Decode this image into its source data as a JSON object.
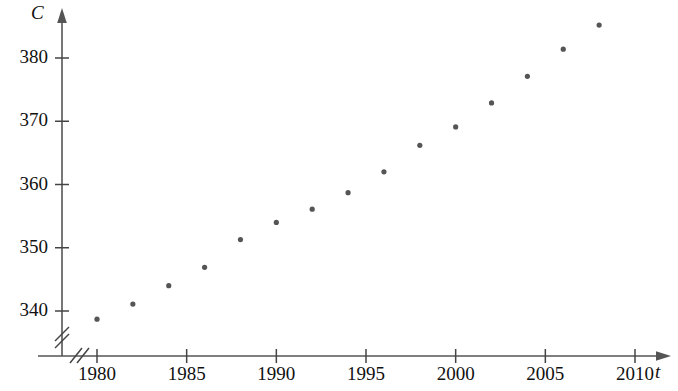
{
  "chart_data": {
    "type": "scatter",
    "title": "",
    "subtitle": "",
    "xlabel": "t",
    "ylabel": "C",
    "xlim": [
      1978,
      2011
    ],
    "ylim": [
      336,
      388
    ],
    "grid": false,
    "legend": "none",
    "axis_break_x": true,
    "axis_break_y": true,
    "point_color": "#555555",
    "axis_color": "#555555",
    "x_ticks": [
      1980,
      1985,
      1990,
      1995,
      2000,
      2005,
      2010
    ],
    "x_tick_labels": [
      "1980",
      "1985",
      "1990",
      "1995",
      "2000",
      "2005",
      "2010"
    ],
    "y_ticks": [
      340,
      350,
      360,
      370,
      380
    ],
    "y_tick_labels": [
      "340",
      "350",
      "360",
      "370",
      "380"
    ],
    "x": [
      1980,
      1982,
      1984,
      1986,
      1988,
      1990,
      1992,
      1994,
      1996,
      1998,
      2000,
      2002,
      2004,
      2006,
      2008
    ],
    "values": [
      338.7,
      341.1,
      344.0,
      346.9,
      351.3,
      354.0,
      356.1,
      358.7,
      362.0,
      366.2,
      369.1,
      372.9,
      377.1,
      381.4,
      385.2
    ],
    "points": [
      {
        "x": 1980,
        "y": 338.7
      },
      {
        "x": 1982,
        "y": 341.1
      },
      {
        "x": 1984,
        "y": 344.0
      },
      {
        "x": 1986,
        "y": 346.9
      },
      {
        "x": 1988,
        "y": 351.3
      },
      {
        "x": 1990,
        "y": 354.0
      },
      {
        "x": 1992,
        "y": 356.1
      },
      {
        "x": 1994,
        "y": 358.7
      },
      {
        "x": 1996,
        "y": 362.0
      },
      {
        "x": 1998,
        "y": 366.2
      },
      {
        "x": 2000,
        "y": 369.1
      },
      {
        "x": 2002,
        "y": 372.9
      },
      {
        "x": 2004,
        "y": 377.1
      },
      {
        "x": 2006,
        "y": 381.4
      },
      {
        "x": 2008,
        "y": 385.2
      }
    ]
  },
  "labels": {
    "y_axis": "C",
    "x_axis": "t"
  }
}
